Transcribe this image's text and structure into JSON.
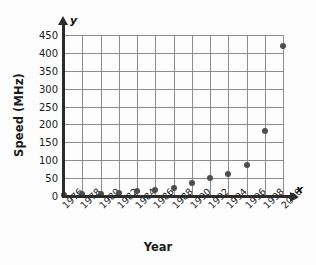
{
  "chart_data": {
    "type": "scatter",
    "title": "",
    "xlabel": "Year",
    "ylabel": "Speed (MHz)",
    "x_axis_letter": "x",
    "y_axis_letter": "y",
    "categories": [
      "1976",
      "1978",
      "1980",
      "1982",
      "1984",
      "1986",
      "1988",
      "1990",
      "1992",
      "1994",
      "1996",
      "1998",
      "2000"
    ],
    "x": [
      1976,
      1978,
      1980,
      1982,
      1984,
      1986,
      1988,
      1990,
      1992,
      1994,
      1996,
      1998,
      2000
    ],
    "values": [
      2,
      5,
      6,
      8,
      15,
      17,
      22,
      36,
      50,
      62,
      88,
      183,
      420
    ],
    "xlim": [
      1976,
      2000
    ],
    "ylim": [
      0,
      450
    ],
    "ytick_labels": [
      "0",
      "50",
      "100",
      "150",
      "200",
      "250",
      "300",
      "350",
      "400",
      "450"
    ],
    "ytick_values": [
      0,
      50,
      100,
      150,
      200,
      250,
      300,
      350,
      400,
      450
    ],
    "grid": true,
    "legend": "none",
    "marker_color": "#4d4d4d",
    "grid_color": "#8c8c8c",
    "axis_color": "#2c2c2c",
    "background_color": "#fdfdfd"
  }
}
